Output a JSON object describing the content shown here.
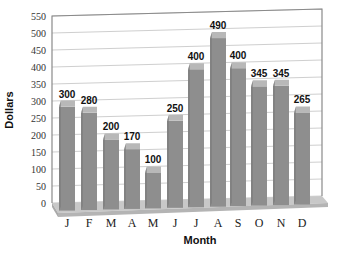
{
  "chart_data": {
    "type": "bar",
    "title": "",
    "xlabel": "Month",
    "ylabel": "Dollars",
    "categories": [
      "J",
      "F",
      "M",
      "A",
      "M",
      "J",
      "J",
      "A",
      "S",
      "O",
      "N",
      "D"
    ],
    "values": [
      300,
      280,
      200,
      170,
      100,
      250,
      400,
      490,
      400,
      345,
      345,
      265
    ],
    "value_labels": [
      "300",
      "280",
      "200",
      "170",
      "100",
      "250",
      "400",
      "490",
      "400",
      "345",
      "345",
      "265"
    ],
    "ylim": [
      0,
      550
    ],
    "yticks": [
      0,
      50,
      100,
      150,
      200,
      250,
      300,
      350,
      400,
      450,
      500,
      550
    ],
    "grid": true,
    "legend": null,
    "style": "3d",
    "colors": {
      "bar_front": "#8e8e8e",
      "bar_top": "#b8b8b8",
      "bar_side": "#7a7a7a",
      "floor": "#c8c8c8",
      "floor_front": "#b4b4b4",
      "grid": "#cfcfcf",
      "frame": "#8a8a8a"
    }
  }
}
